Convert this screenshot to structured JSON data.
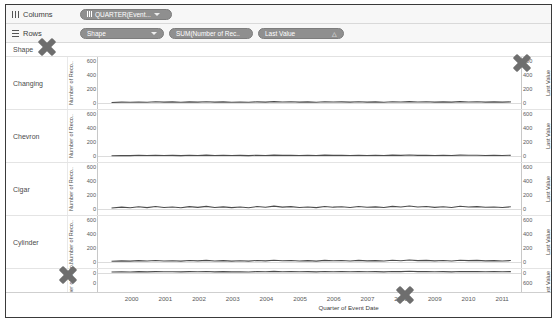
{
  "shelves": {
    "columns": {
      "label": "Columns",
      "icon": "columns-grip-icon",
      "pills": [
        {
          "name": "quarter-event-date-pill",
          "text": "QUARTER(Event..."
        }
      ]
    },
    "rows": {
      "label": "Rows",
      "icon": "rows-hamburger-icon",
      "pills": [
        {
          "name": "shape-pill",
          "text": "Shape"
        },
        {
          "name": "sum-number-of-records-pill",
          "text": "SUM(Number of Rec.."
        },
        {
          "name": "last-value-pill",
          "text": "Last Value",
          "badge": "△"
        }
      ]
    }
  },
  "viz": {
    "row_header_title": "Shape",
    "rows": [
      "Changing",
      "Chevron",
      "Cigar",
      "Cylinder",
      ""
    ],
    "left_axis_title": "Number of Reco..",
    "right_axis_title": "Last Value",
    "left_axis_ticks": [
      "600",
      "400",
      "200",
      "0"
    ],
    "right_axis_ticks": [
      "600",
      "400",
      "200",
      "0"
    ],
    "partial_left_ticks": [
      "0",
      "0",
      "400"
    ],
    "partial_right_ticks": [
      "600",
      "400"
    ],
    "x_title": "Quarter of Event Date",
    "x_ticks": [
      "2000",
      "2001",
      "2002",
      "2003",
      "2004",
      "2005",
      "2006",
      "2007",
      "2008",
      "2009",
      "2010",
      "2011"
    ]
  },
  "chart_data": {
    "type": "line",
    "title": "",
    "xlabel": "Quarter of Event Date",
    "ylabel": "Number of Records",
    "y2label": "Last Value",
    "ylim": [
      0,
      700
    ],
    "xlim": [
      1999.5,
      2012.0
    ],
    "grid": false,
    "legend": "none",
    "x": [
      1999.9,
      2000.2,
      2000.45,
      2000.7,
      2000.95,
      2001.2,
      2001.45,
      2001.7,
      2001.95,
      2002.2,
      2002.45,
      2002.7,
      2002.95,
      2003.2,
      2003.45,
      2003.7,
      2003.95,
      2004.2,
      2004.45,
      2004.7,
      2004.95,
      2005.2,
      2005.45,
      2005.7,
      2005.95,
      2006.2,
      2006.45,
      2006.7,
      2006.95,
      2007.2,
      2007.45,
      2007.7,
      2007.95,
      2008.2,
      2008.45,
      2008.7,
      2008.95,
      2009.2,
      2009.45,
      2009.7,
      2009.95,
      2010.2,
      2010.45,
      2010.7,
      2010.95,
      2011.2,
      2011.45,
      2011.7
    ],
    "series": [
      {
        "name": "Changing",
        "color": "#4d4d4d",
        "values": [
          14,
          20,
          16,
          22,
          18,
          25,
          19,
          23,
          17,
          24,
          20,
          26,
          19,
          23,
          18,
          22,
          17,
          24,
          20,
          27,
          21,
          25,
          19,
          23,
          18,
          26,
          21,
          24,
          19,
          25,
          20,
          23,
          18,
          26,
          22,
          28,
          21,
          25,
          20,
          24,
          19,
          27,
          22,
          25,
          20,
          23,
          19,
          24
        ]
      },
      {
        "name": "Chevron",
        "color": "#4d4d4d",
        "values": [
          10,
          14,
          11,
          16,
          12,
          18,
          13,
          15,
          11,
          17,
          13,
          19,
          12,
          16,
          12,
          15,
          11,
          17,
          14,
          20,
          15,
          18,
          13,
          16,
          12,
          19,
          15,
          17,
          13,
          18,
          14,
          16,
          12,
          19,
          15,
          21,
          15,
          18,
          14,
          17,
          13,
          20,
          16,
          18,
          14,
          16,
          13,
          17
        ]
      },
      {
        "name": "Cigar",
        "color": "#4d4d4d",
        "values": [
          22,
          36,
          26,
          42,
          28,
          46,
          30,
          38,
          26,
          44,
          31,
          48,
          29,
          40,
          27,
          37,
          26,
          45,
          33,
          52,
          36,
          44,
          30,
          39,
          28,
          47,
          35,
          42,
          30,
          45,
          33,
          40,
          29,
          48,
          37,
          55,
          38,
          45,
          32,
          41,
          29,
          50,
          38,
          44,
          33,
          39,
          30,
          42
        ]
      },
      {
        "name": "Cylinder",
        "color": "#4d4d4d",
        "values": [
          16,
          24,
          19,
          28,
          21,
          30,
          22,
          26,
          19,
          29,
          23,
          32,
          21,
          27,
          20,
          25,
          19,
          30,
          24,
          35,
          26,
          30,
          22,
          27,
          20,
          32,
          25,
          29,
          22,
          31,
          24,
          28,
          21,
          33,
          26,
          38,
          27,
          31,
          23,
          29,
          21,
          34,
          27,
          31,
          24,
          28,
          22,
          29
        ]
      },
      {
        "name": "",
        "color": "#4d4d4d",
        "values": [
          12,
          18,
          14,
          21,
          16,
          22,
          17,
          19,
          15,
          21,
          17,
          24,
          16,
          20,
          15,
          19,
          14,
          22,
          18,
          26,
          19,
          23,
          17,
          20,
          15,
          24,
          19,
          22,
          17,
          23,
          18,
          21,
          16,
          25,
          20,
          28,
          20,
          23,
          18,
          21,
          16,
          25,
          20,
          23,
          18,
          21,
          17,
          22
        ]
      }
    ]
  },
  "cursors": [
    {
      "name": "cursor-marker-shape-header",
      "x": 36,
      "y": 36
    },
    {
      "name": "cursor-marker-right-axis",
      "x": 511,
      "y": 52
    },
    {
      "name": "cursor-marker-left-axis-bottom",
      "x": 57,
      "y": 264
    },
    {
      "name": "cursor-marker-x-axis",
      "x": 394,
      "y": 284
    }
  ]
}
